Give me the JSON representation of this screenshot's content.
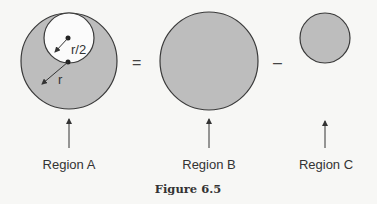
{
  "figure": {
    "caption": "Figure 6.5",
    "equation": {
      "equals": "=",
      "minus": "–"
    },
    "regions": [
      {
        "label": "Region A",
        "description": "large shaded circle with unshaded inner circle removed"
      },
      {
        "label": "Region B",
        "description": "large shaded circle of radius r"
      },
      {
        "label": "Region C",
        "description": "small shaded circle of radius r/2"
      }
    ],
    "annotations": {
      "inner_radius": "r/2",
      "outer_radius": "r"
    },
    "colors": {
      "fill": "#bdbdbd",
      "stroke": "#3a3a3a",
      "background": "#f7f7f5"
    }
  }
}
